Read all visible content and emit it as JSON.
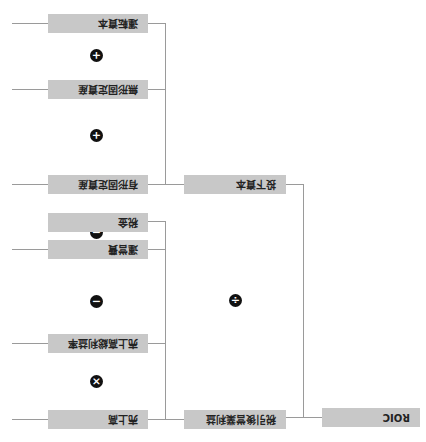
{
  "diagram": {
    "root": {
      "label": "ROIC"
    },
    "level1": [
      {
        "label": "税引後営業利益"
      },
      {
        "label": "投下資本"
      }
    ],
    "nopat_inputs": [
      {
        "label": "売上高"
      },
      {
        "label": "売上高総利益率"
      },
      {
        "label": "運営費"
      },
      {
        "label": "税金"
      }
    ],
    "capital_inputs": [
      {
        "label": "有形固定資産"
      },
      {
        "label": "無形固定資産"
      },
      {
        "label": "運転資本"
      }
    ],
    "operators": {
      "root": "÷",
      "sales_x_margin": "×",
      "minus_opex": "−",
      "minus_tax": "−",
      "plus_1": "+",
      "plus_2": "+"
    },
    "colors": {
      "box": "#c8c8c8",
      "line": "#9a9a9a",
      "operator": "#111111"
    }
  }
}
